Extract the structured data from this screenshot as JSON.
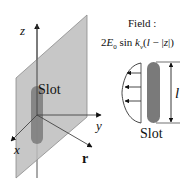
{
  "left_figure": {
    "axes": {
      "z_label": "z",
      "y_label": "y",
      "x_label": "x",
      "r_label": "r"
    },
    "slot_label": "Slot"
  },
  "right_figure": {
    "field_title": "Field :",
    "formula": {
      "prefix": "2",
      "E": "E",
      "E_sub": "0",
      "sin": "sin",
      "k": "k",
      "k_sub": "v",
      "open": "(",
      "l": "l",
      "minus": " − ",
      "abs_open": "|",
      "z": "z",
      "abs_close": "|",
      "close": ")"
    },
    "length_label": "l",
    "slot_label": "Slot"
  },
  "colors": {
    "plane_fill": "#bdbdbd",
    "plane_edge": "#8c8c8c",
    "slot_fill": "#7a7a7a",
    "line": "#333333",
    "text": "#111111"
  }
}
